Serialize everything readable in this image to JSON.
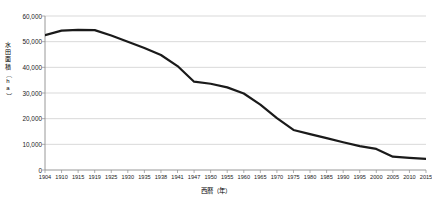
{
  "chart_data": {
    "type": "line",
    "title": "",
    "xlabel": "西暦（年）",
    "ylabel": "水田面積（ha）",
    "ylabel_chars": [
      "水",
      "田",
      "面",
      "積",
      "（",
      "h",
      "a",
      "）"
    ],
    "categories": [
      "1904",
      "1910",
      "1915",
      "1919",
      "1925",
      "1930",
      "1935",
      "1938",
      "1941",
      "1947",
      "1950",
      "1955",
      "1960",
      "1965",
      "1970",
      "1975",
      "1980",
      "1985",
      "1990",
      "1995",
      "2000",
      "2005",
      "2010",
      "2015"
    ],
    "values": [
      52500,
      54300,
      54600,
      54500,
      52400,
      50000,
      47500,
      44800,
      40500,
      34400,
      33600,
      32200,
      29800,
      25500,
      20200,
      15600,
      14000,
      12400,
      10800,
      9300,
      8200,
      5200,
      4700,
      4300
    ],
    "ylim": [
      0,
      60000
    ],
    "ytick_values": [
      0,
      10000,
      20000,
      30000,
      40000,
      50000,
      60000
    ],
    "ytick_labels": [
      "0",
      "10,000",
      "20,000",
      "30,000",
      "40,000",
      "50,000",
      "60,000"
    ],
    "grid": "horizontal",
    "legend": "none",
    "series_color": "#1a1a1a",
    "grid_color": "#c9c9c9",
    "axis_color": "#8c8c8c",
    "line_width": 2.2
  }
}
